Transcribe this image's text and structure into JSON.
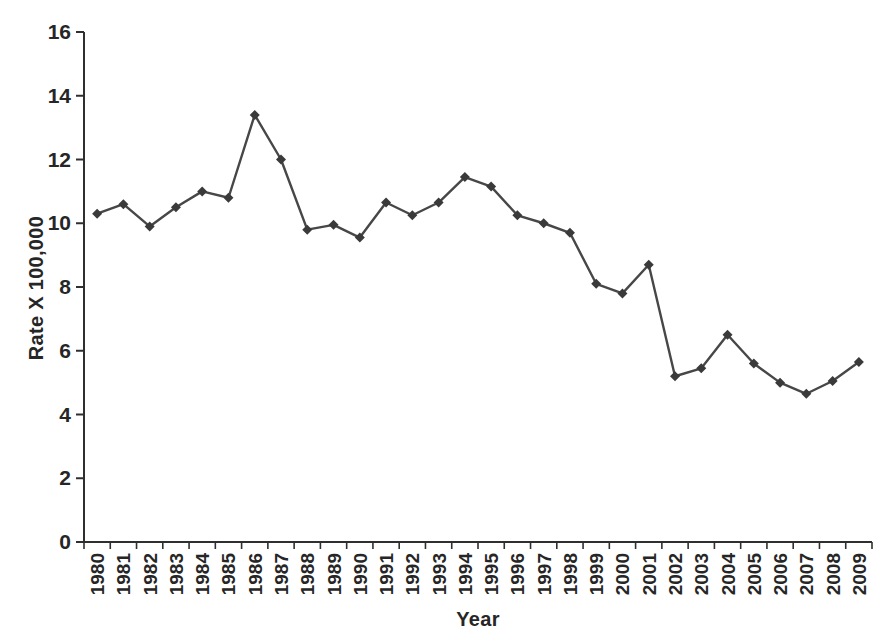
{
  "figure": {
    "background": "#ffffff",
    "axis_color": "#2f2f2f",
    "text_color": "#262626",
    "line_color": "#474747",
    "marker_color": "#3a3a3a"
  },
  "chart_data": {
    "type": "line",
    "title": "",
    "xlabel": "Year",
    "ylabel": "Rate X 100,000",
    "categories": [
      "1980",
      "1981",
      "1982",
      "1983",
      "1984",
      "1985",
      "1986",
      "1987",
      "1988",
      "1989",
      "1990",
      "1991",
      "1992",
      "1993",
      "1994",
      "1995",
      "1996",
      "1997",
      "1998",
      "1999",
      "2000",
      "2001",
      "2002",
      "2003",
      "2004",
      "2005",
      "2006",
      "2007",
      "2008",
      "2009"
    ],
    "series": [
      {
        "name": "rate",
        "values": [
          10.3,
          10.6,
          9.9,
          10.5,
          11.0,
          10.8,
          13.4,
          12.0,
          9.8,
          9.95,
          9.55,
          10.65,
          10.25,
          10.65,
          11.45,
          11.15,
          10.25,
          10.0,
          9.7,
          8.1,
          7.8,
          8.7,
          5.2,
          5.45,
          6.5,
          5.6,
          5.0,
          4.65,
          5.05,
          5.65
        ]
      }
    ],
    "ylim": [
      0,
      16
    ],
    "yticks": [
      "0",
      "2",
      "4",
      "6",
      "8",
      "10",
      "12",
      "14",
      "16"
    ],
    "grid": false,
    "legend": "none",
    "marker": "diamond"
  }
}
